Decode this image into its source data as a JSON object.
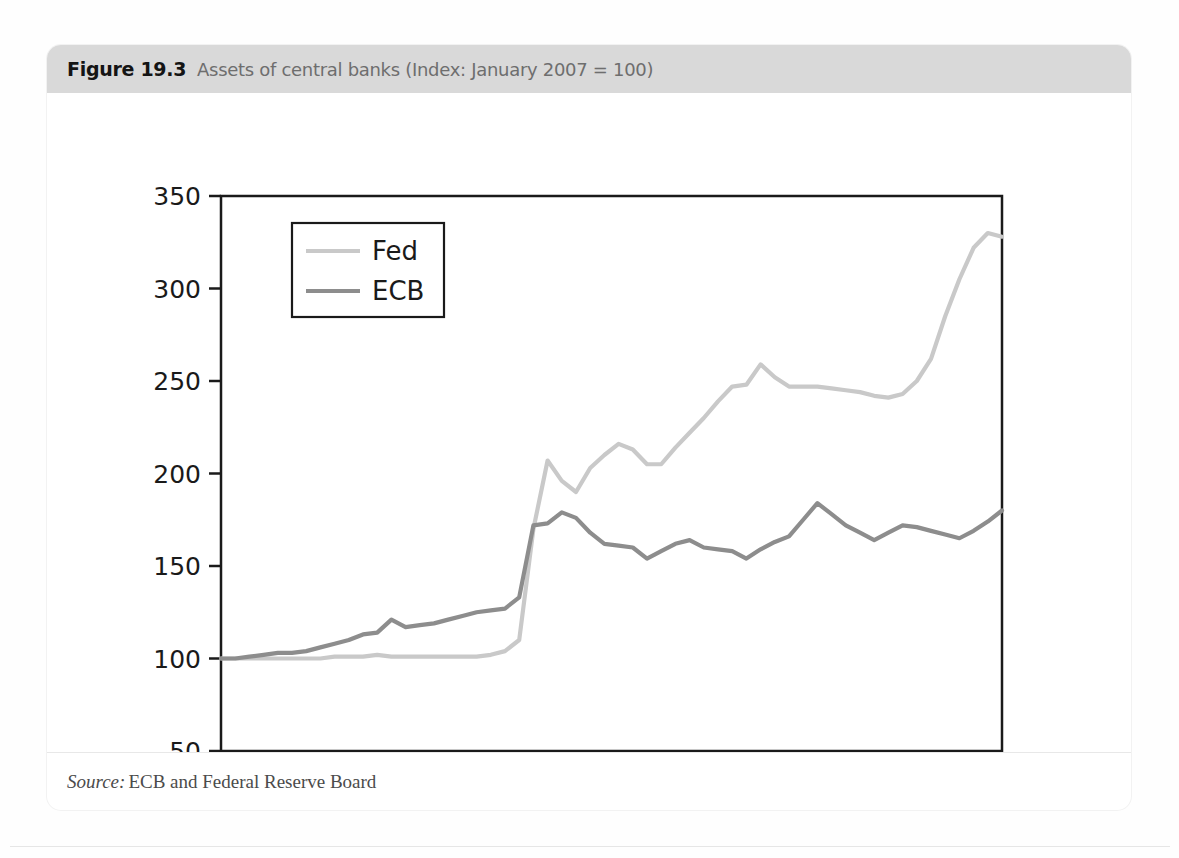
{
  "figure": {
    "label": "Figure 19.3",
    "title": "Assets of central banks (Index: January 2007 = 100)",
    "source_word": "Source:",
    "source_text": "ECB and Federal Reserve Board"
  },
  "colors": {
    "header_band": "#d9d9d9",
    "fed_line": "#c9c9c9",
    "ecb_line": "#8d8d8d",
    "axis": "#1a1a1a",
    "card": "#ffffff"
  },
  "chart_data": {
    "type": "line",
    "title": "Assets of central banks (Index: January 2007 = 100)",
    "xlabel": "",
    "ylabel": "",
    "ylim": [
      50,
      350
    ],
    "yticks": [
      50,
      100,
      150,
      200,
      250,
      300,
      350
    ],
    "xticks": [
      "2007-01",
      "2007-07",
      "2008-01",
      "2008-07",
      "2009-01",
      "2009-07",
      "2010-01",
      "2010-07",
      "2011-01",
      "2011-07"
    ],
    "grid": false,
    "legend_position": "upper left",
    "x": [
      "2007-01",
      "2007-02",
      "2007-03",
      "2007-04",
      "2007-05",
      "2007-06",
      "2007-07",
      "2007-08",
      "2007-09",
      "2007-10",
      "2007-11",
      "2007-12",
      "2008-01",
      "2008-02",
      "2008-03",
      "2008-04",
      "2008-05",
      "2008-06",
      "2008-07",
      "2008-08",
      "2008-09",
      "2008-10",
      "2008-11",
      "2008-12",
      "2009-01",
      "2009-02",
      "2009-03",
      "2009-04",
      "2009-05",
      "2009-06",
      "2009-07",
      "2009-08",
      "2009-09",
      "2009-10",
      "2009-11",
      "2009-12",
      "2010-01",
      "2010-02",
      "2010-03",
      "2010-04",
      "2010-05",
      "2010-06",
      "2010-07",
      "2010-08",
      "2010-09",
      "2010-10",
      "2010-11",
      "2010-12",
      "2011-01",
      "2011-02",
      "2011-03",
      "2011-04",
      "2011-05",
      "2011-06",
      "2011-07",
      "2011-08"
    ],
    "series": [
      {
        "name": "Fed",
        "color": "#c9c9c9",
        "values": [
          100,
          100,
          100,
          100,
          100,
          100,
          100,
          100,
          101,
          101,
          101,
          102,
          101,
          101,
          101,
          101,
          101,
          101,
          101,
          102,
          104,
          110,
          170,
          207,
          196,
          190,
          203,
          210,
          216,
          213,
          205,
          205,
          214,
          222,
          230,
          239,
          247,
          248,
          259,
          252,
          247,
          247,
          247,
          246,
          245,
          244,
          242,
          241,
          243,
          250,
          262,
          285,
          305,
          322,
          330,
          328
        ]
      },
      {
        "name": "ECB",
        "color": "#8d8d8d",
        "values": [
          100,
          100,
          101,
          102,
          103,
          103,
          104,
          106,
          108,
          110,
          113,
          114,
          121,
          117,
          118,
          119,
          121,
          123,
          125,
          126,
          127,
          133,
          172,
          173,
          179,
          176,
          168,
          162,
          161,
          160,
          154,
          158,
          162,
          164,
          160,
          159,
          158,
          154,
          159,
          163,
          166,
          175,
          184,
          178,
          172,
          168,
          164,
          168,
          172,
          171,
          169,
          167,
          165,
          169,
          174,
          180
        ]
      }
    ]
  }
}
